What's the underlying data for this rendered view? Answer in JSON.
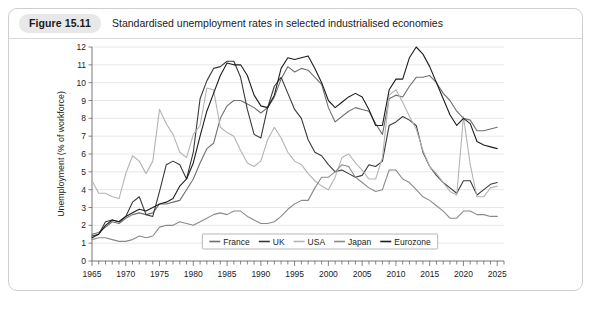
{
  "figure": {
    "badge": "Figure 15.11",
    "title": "Standardised unemployment rates in selected industrialised economies"
  },
  "source_note": "",
  "colors": {
    "france": "#6f6f6f",
    "uk": "#3a3a3a",
    "usa": "#b4b4b4",
    "japan": "#8a8a8a",
    "eurozone": "#1d1d1d",
    "grid": "#d7d7d7",
    "axis": "#555555",
    "badge_bg": "#e8e8e8",
    "card_border": "#cfcfcf"
  },
  "chart_data": {
    "type": "line",
    "title": "Standardised unemployment rates in selected industrialised economies",
    "xlabel": "",
    "ylabel": "Unemployment (% of workforce)",
    "xlim": [
      1965,
      2026
    ],
    "ylim": [
      0,
      12
    ],
    "grid": true,
    "legend_position": "bottom-center",
    "x_ticks": [
      1965,
      1970,
      1975,
      1980,
      1985,
      1990,
      1995,
      2000,
      2005,
      2010,
      2015,
      2020,
      2025
    ],
    "x_minor_tick_step": 1,
    "y_ticks": [
      0,
      1,
      2,
      3,
      4,
      5,
      6,
      7,
      8,
      9,
      10,
      11,
      12
    ],
    "x": [
      1965,
      1966,
      1967,
      1968,
      1969,
      1970,
      1971,
      1972,
      1973,
      1974,
      1975,
      1976,
      1977,
      1978,
      1979,
      1980,
      1981,
      1982,
      1983,
      1984,
      1985,
      1986,
      1987,
      1988,
      1989,
      1990,
      1991,
      1992,
      1993,
      1994,
      1995,
      1996,
      1997,
      1998,
      1999,
      2000,
      2001,
      2002,
      2003,
      2004,
      2005,
      2006,
      2007,
      2008,
      2009,
      2010,
      2011,
      2012,
      2013,
      2014,
      2015,
      2016,
      2017,
      2018,
      2019,
      2020,
      2021,
      2022,
      2023,
      2024,
      2025
    ],
    "series": [
      {
        "name": "France",
        "color": "#6f6f6f",
        "values": [
          1.5,
          1.6,
          1.9,
          2.2,
          2.1,
          2.4,
          2.6,
          2.7,
          2.6,
          2.7,
          3.2,
          3.2,
          3.3,
          3.4,
          4.0,
          4.6,
          5.5,
          6.3,
          6.6,
          8.0,
          8.7,
          9.0,
          9.0,
          8.8,
          8.6,
          8.3,
          8.6,
          9.2,
          10.2,
          10.9,
          10.6,
          10.8,
          10.7,
          10.3,
          9.9,
          8.6,
          7.8,
          8.1,
          8.4,
          8.6,
          8.5,
          8.4,
          7.7,
          7.1,
          9.1,
          9.3,
          9.2,
          9.8,
          10.3,
          10.3,
          10.4,
          10.0,
          9.4,
          9.0,
          8.4,
          8.0,
          7.9,
          7.3,
          7.3,
          7.4,
          7.5
        ]
      },
      {
        "name": "UK",
        "color": "#3a3a3a",
        "values": [
          1.4,
          1.5,
          2.2,
          2.3,
          2.2,
          2.5,
          3.3,
          3.6,
          2.6,
          2.5,
          3.9,
          5.4,
          5.6,
          5.4,
          4.6,
          6.1,
          9.1,
          10.1,
          10.8,
          10.9,
          11.2,
          11.2,
          10.3,
          8.5,
          7.1,
          6.9,
          8.6,
          9.8,
          10.3,
          9.4,
          8.5,
          8.0,
          6.8,
          6.1,
          5.9,
          5.4,
          5.0,
          5.1,
          4.9,
          4.7,
          4.8,
          5.4,
          5.3,
          5.6,
          7.6,
          7.8,
          8.1,
          7.9,
          7.6,
          6.1,
          5.3,
          4.8,
          4.4,
          4.1,
          3.8,
          4.5,
          4.5,
          3.7,
          4.0,
          4.3,
          4.4
        ]
      },
      {
        "name": "USA",
        "color": "#b4b4b4",
        "values": [
          4.5,
          3.8,
          3.8,
          3.6,
          3.5,
          4.9,
          5.9,
          5.6,
          4.9,
          5.6,
          8.5,
          7.7,
          7.1,
          6.1,
          5.8,
          7.1,
          7.6,
          9.7,
          9.6,
          7.5,
          7.2,
          7.0,
          6.2,
          5.5,
          5.3,
          5.6,
          6.8,
          7.5,
          6.9,
          6.1,
          5.6,
          5.4,
          4.9,
          4.5,
          4.2,
          4.0,
          4.7,
          5.8,
          6.0,
          5.5,
          5.1,
          4.6,
          4.6,
          5.8,
          9.3,
          9.6,
          8.9,
          8.1,
          7.4,
          6.2,
          5.3,
          4.9,
          4.4,
          3.9,
          3.7,
          8.1,
          5.4,
          3.6,
          3.6,
          4.1,
          4.2
        ]
      },
      {
        "name": "Japan",
        "color": "#8a8a8a",
        "values": [
          1.2,
          1.3,
          1.3,
          1.2,
          1.1,
          1.1,
          1.2,
          1.4,
          1.3,
          1.4,
          1.9,
          2.0,
          2.0,
          2.2,
          2.1,
          2.0,
          2.2,
          2.4,
          2.6,
          2.7,
          2.6,
          2.8,
          2.8,
          2.5,
          2.3,
          2.1,
          2.1,
          2.2,
          2.5,
          2.9,
          3.2,
          3.4,
          3.4,
          4.1,
          4.7,
          4.7,
          5.0,
          5.4,
          5.3,
          4.7,
          4.4,
          4.1,
          3.9,
          4.0,
          5.1,
          5.1,
          4.6,
          4.4,
          4.0,
          3.6,
          3.4,
          3.1,
          2.8,
          2.4,
          2.4,
          2.8,
          2.8,
          2.6,
          2.6,
          2.5,
          2.5
        ]
      },
      {
        "name": "Eurozone",
        "color": "#1d1d1d",
        "values": [
          1.3,
          1.5,
          2.0,
          2.3,
          2.2,
          2.5,
          2.7,
          2.9,
          2.8,
          3.0,
          3.2,
          3.3,
          3.5,
          4.2,
          4.6,
          5.5,
          7.0,
          8.4,
          9.4,
          10.4,
          11.1,
          11.0,
          11.0,
          10.4,
          9.3,
          8.7,
          8.6,
          9.3,
          10.8,
          11.4,
          11.3,
          11.4,
          11.5,
          10.8,
          10.0,
          9.0,
          8.6,
          8.9,
          9.2,
          9.4,
          9.2,
          8.5,
          7.6,
          7.6,
          9.6,
          10.2,
          10.2,
          11.4,
          12.0,
          11.6,
          10.9,
          10.0,
          9.1,
          8.2,
          7.6,
          8.0,
          7.7,
          6.7,
          6.5,
          6.4,
          6.3
        ]
      }
    ]
  }
}
